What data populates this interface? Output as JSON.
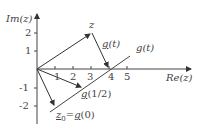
{
  "diagram": {
    "axis_labels": {
      "y": "Im(z)",
      "x": "Re(z)"
    },
    "x_ticks": [
      "1",
      "2",
      "3",
      "4",
      "5"
    ],
    "y_ticks": [
      "2",
      "1",
      "-1",
      "-2"
    ],
    "labels": {
      "z": "z",
      "g_t_vector_g": "g",
      "g_t_vector_rest": "(t)",
      "g_t_line": "g(t)",
      "g_half_g": "g",
      "g_half_rest": "(1/2)",
      "z0_z": "z",
      "z0_sub": "0",
      "z0_eq": "=",
      "z0_g": "g",
      "z0_rest": "(0)"
    },
    "points": {
      "origin": [
        0,
        0
      ],
      "z": [
        3,
        2
      ],
      "z0": [
        1,
        -2
      ],
      "g_half": [
        2.5,
        -1
      ],
      "line_end": [
        4,
        0
      ]
    },
    "colors": {
      "ink": "#444444",
      "background": "#ffffff"
    }
  }
}
